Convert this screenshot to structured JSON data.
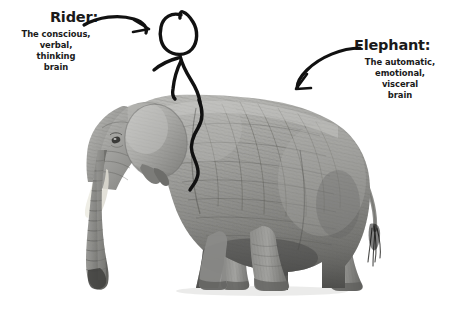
{
  "canvas": {
    "width": 450,
    "height": 313,
    "background": "#ffffff"
  },
  "diagram": {
    "title_visible": false,
    "type": "annotated-photo-illustration",
    "text_color": "#1a1a1a",
    "ink_color": "#111111"
  },
  "labels": {
    "rider": {
      "title": "Rider:",
      "lines": [
        "The conscious,",
        "verbal,",
        "thinking",
        "brain"
      ]
    },
    "elephant": {
      "title": "Elephant:",
      "lines": [
        "The automatic,",
        "emotional,",
        "visceral",
        "brain"
      ]
    }
  },
  "arrows": {
    "rider_arrow": {
      "name": "arrow-to-rider",
      "direction": "right",
      "description": "curved arrow pointing right toward the stick figure"
    },
    "elephant_arrow": {
      "name": "arrow-to-elephant",
      "direction": "down-left",
      "description": "curved arrow pointing down-left toward the elephant body"
    }
  },
  "figure": {
    "name": "stick-figure-rider"
  },
  "photo": {
    "name": "elephant-photograph",
    "description": "grayscale side view photograph of an African elephant facing left",
    "palette": {
      "skin_light": "#c9c9c7",
      "skin_mid": "#9a9a98",
      "skin_dark": "#6d6d6b",
      "shadow": "#4a4a49",
      "tusk": "#f0efe9"
    }
  }
}
